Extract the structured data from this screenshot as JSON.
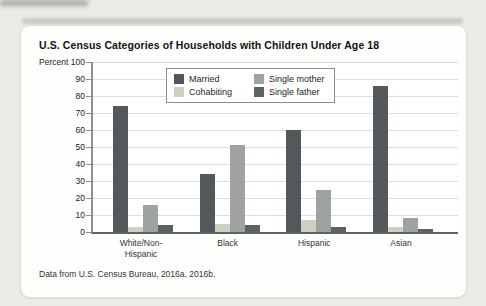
{
  "page": {
    "footnote": "Data from U.S. Census Bureau, 2016a, 2016b."
  },
  "chart_data": {
    "type": "bar",
    "title": "U.S. Census Categories of Households with Children Under Age 18",
    "ylabel": "Percent",
    "xlabel": "",
    "ylim": [
      0,
      100
    ],
    "ytick_interval": 10,
    "grid": true,
    "legend_position": "top-center-inside",
    "categories": [
      "White/Non-\nHispanic",
      "Black",
      "Hispanic",
      "Asian"
    ],
    "series": [
      {
        "name": "Married",
        "color": "#53585a",
        "values": [
          74,
          34,
          60,
          86
        ]
      },
      {
        "name": "Cohabiting",
        "color": "#cdd1c3",
        "values": [
          3,
          5,
          7,
          3
        ]
      },
      {
        "name": "Single mother",
        "color": "#9ea3a0",
        "values": [
          16,
          51,
          25,
          8
        ]
      },
      {
        "name": "Single father",
        "color": "#5d6365",
        "values": [
          4,
          4,
          3,
          2
        ]
      }
    ],
    "axis_colors": {
      "y_axis": "#8b9091",
      "x_axis": "#5d6263",
      "gridline": "#dcdedb"
    }
  }
}
